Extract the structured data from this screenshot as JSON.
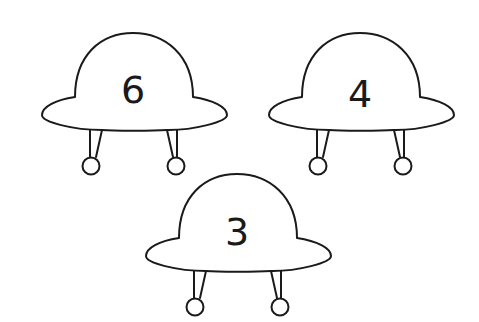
{
  "ufos": [
    {
      "id": "ufo-1",
      "number": "6",
      "cx": 133,
      "top": 0
    },
    {
      "id": "ufo-2",
      "number": "4",
      "cx": 360,
      "top": 0
    },
    {
      "id": "ufo-3",
      "number": "3",
      "cx": 237,
      "top": 141
    }
  ],
  "colors": {
    "stroke": "#1a1a1a",
    "fill": "#ffffff",
    "background": "#ffffff"
  }
}
